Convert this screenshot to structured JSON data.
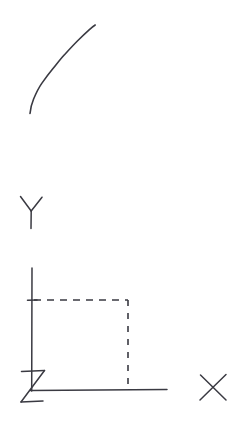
{
  "figure": {
    "background_color": "#ffffff",
    "ink_color": "#3a3a42",
    "width": 237,
    "height": 431
  },
  "labels": {
    "x_axis": "X",
    "y_axis": "Y",
    "origin": "Z"
  },
  "chart_data": {
    "type": "line",
    "title": "",
    "xlabel": "X",
    "ylabel": "Y",
    "grid": false,
    "legend": null,
    "annotations": [
      {
        "name": "origin-label",
        "text": "Z",
        "x_px": 34,
        "y_px": 388
      },
      {
        "name": "x-axis-label",
        "text": "X",
        "x_px": 213,
        "y_px": 387
      },
      {
        "name": "y-axis-label",
        "text": "Y",
        "x_px": 31,
        "y_px": 212
      }
    ],
    "series": [
      {
        "name": "concave-increasing-curve",
        "style": "solid",
        "points_px": [
          [
            30,
            113
          ],
          [
            34,
            101
          ],
          [
            39,
            89
          ],
          [
            45,
            78
          ],
          [
            52,
            68
          ],
          [
            60,
            58
          ],
          [
            69,
            48
          ],
          [
            79,
            38
          ],
          [
            88,
            30
          ],
          [
            95,
            25
          ]
        ]
      },
      {
        "name": "projection-lines",
        "style": "dashed",
        "points_px": [
          [
            32,
            300
          ],
          [
            128,
            300
          ],
          [
            128,
            390
          ]
        ]
      }
    ],
    "axes_px": {
      "y_axis": [
        [
          32,
          268
        ],
        [
          32,
          390
        ]
      ],
      "x_axis": [
        [
          32,
          390
        ],
        [
          167,
          390
        ]
      ],
      "y_tick_at_value": [
        [
          27,
          300
        ],
        [
          37,
          300
        ]
      ]
    }
  }
}
